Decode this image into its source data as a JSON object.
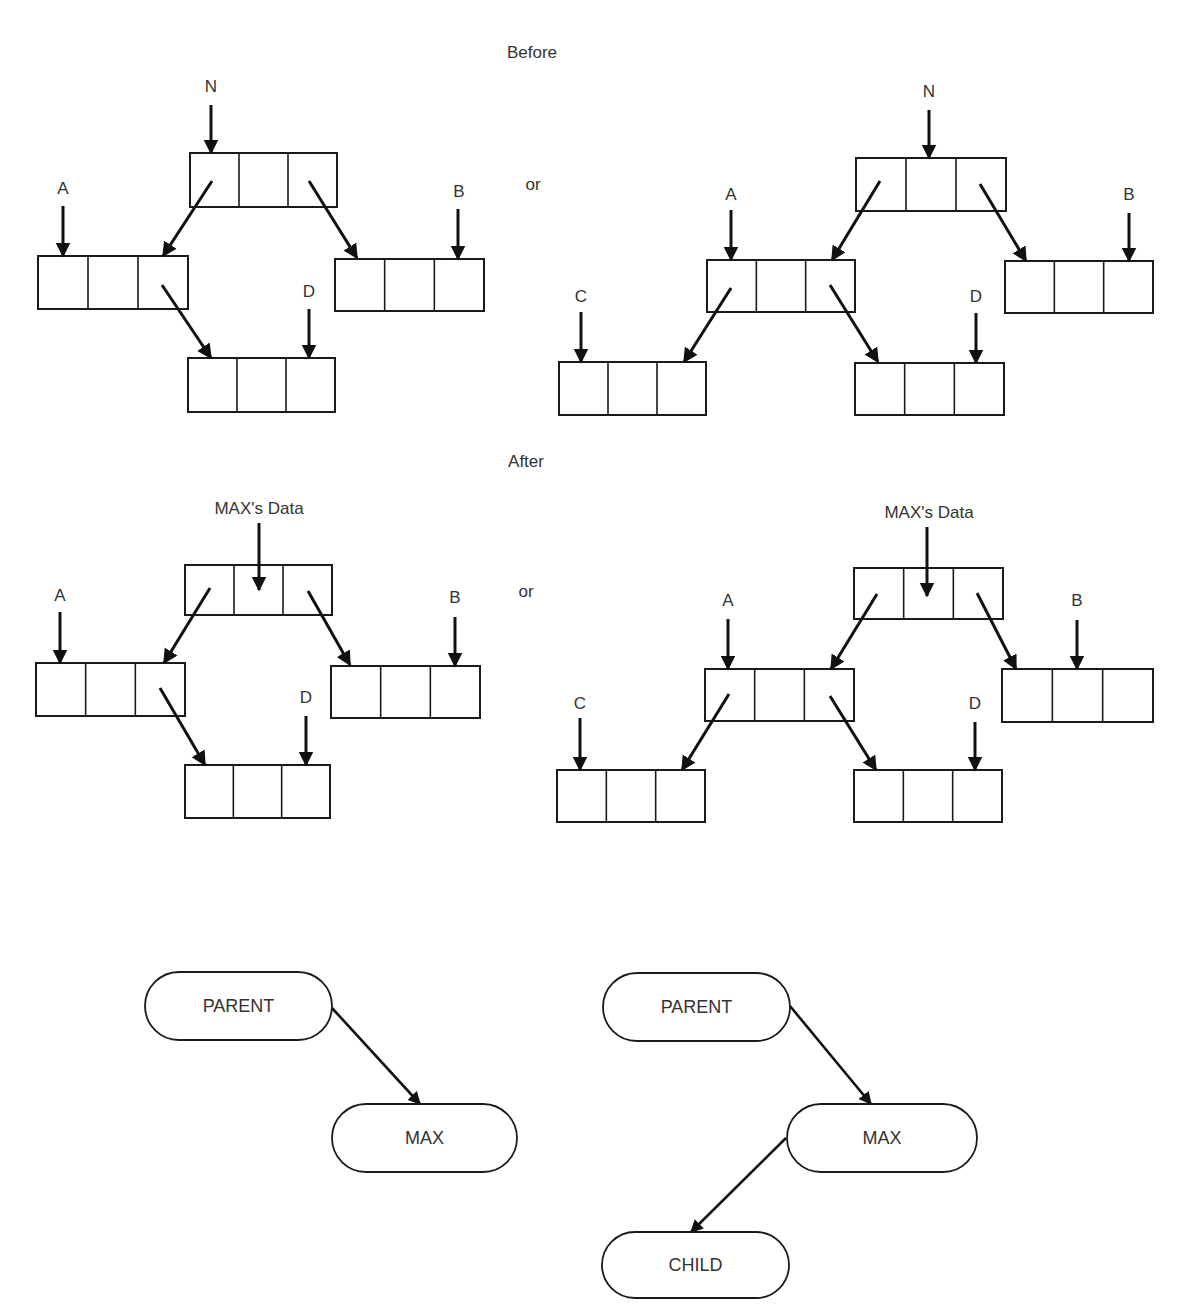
{
  "figure": {
    "section_before_label": "Before",
    "section_after_label": "After",
    "or_label": "or",
    "colors": {
      "ink": "#1a1a1a",
      "text": "#333333",
      "background": "#ffffff"
    }
  },
  "sections": [
    {
      "id": "before",
      "title": {
        "text": "Before",
        "x": 532,
        "y": 58
      },
      "or_text": {
        "text": "or",
        "x": 533,
        "y": 190
      },
      "diagrams": [
        {
          "id": "before-left",
          "boxes": [
            {
              "id": "N",
              "x": 190,
              "y": 153,
              "w": 147,
              "h": 54
            },
            {
              "id": "A",
              "x": 38,
              "y": 256,
              "w": 150,
              "h": 53
            },
            {
              "id": "B",
              "x": 335,
              "y": 259,
              "w": 149,
              "h": 52
            },
            {
              "id": "D",
              "x": 188,
              "y": 358,
              "w": 147,
              "h": 54
            }
          ],
          "pointer_labels": [
            {
              "text": "N",
              "x": 211,
              "y": 92,
              "arrow": [
                211,
                105,
                211,
                153
              ]
            },
            {
              "text": "A",
              "x": 63,
              "y": 194,
              "arrow": [
                63,
                206,
                63,
                256
              ]
            },
            {
              "text": "B",
              "x": 459,
              "y": 197,
              "arrow": [
                458,
                209,
                458,
                259
              ]
            },
            {
              "text": "D",
              "x": 309,
              "y": 297,
              "arrow": [
                309,
                309,
                309,
                358
              ]
            }
          ],
          "links": [
            [
              212,
              181,
              163,
              256
            ],
            [
              309,
              181,
              357,
              258
            ],
            [
              162,
              285,
              211,
              358
            ]
          ]
        },
        {
          "id": "before-right",
          "boxes": [
            {
              "id": "N",
              "x": 856,
              "y": 158,
              "w": 150,
              "h": 53
            },
            {
              "id": "A",
              "x": 707,
              "y": 260,
              "w": 148,
              "h": 52
            },
            {
              "id": "B",
              "x": 1005,
              "y": 261,
              "w": 148,
              "h": 52
            },
            {
              "id": "C",
              "x": 559,
              "y": 362,
              "w": 147,
              "h": 53
            },
            {
              "id": "D",
              "x": 855,
              "y": 363,
              "w": 149,
              "h": 52
            }
          ],
          "pointer_labels": [
            {
              "text": "N",
              "x": 929,
              "y": 97,
              "arrow": [
                929,
                110,
                929,
                158
              ]
            },
            {
              "text": "A",
              "x": 731,
              "y": 200,
              "arrow": [
                731,
                210,
                731,
                260
              ]
            },
            {
              "text": "B",
              "x": 1129,
              "y": 200,
              "arrow": [
                1129,
                213,
                1129,
                261
              ]
            },
            {
              "text": "C",
              "x": 581,
              "y": 302,
              "arrow": [
                581,
                312,
                581,
                362
              ]
            },
            {
              "text": "D",
              "x": 976,
              "y": 302,
              "arrow": [
                976,
                313,
                976,
                363
              ]
            }
          ],
          "links": [
            [
              880,
              181,
              832,
              260
            ],
            [
              980,
              184,
              1026,
              261
            ],
            [
              731,
              288,
              684,
              362
            ],
            [
              830,
              285,
              878,
              362
            ]
          ]
        }
      ]
    },
    {
      "id": "after",
      "title": {
        "text": "After",
        "x": 526,
        "y": 467
      },
      "or_text": {
        "text": "or",
        "x": 526,
        "y": 597
      },
      "diagrams": [
        {
          "id": "after-left",
          "boxes": [
            {
              "id": "MAX",
              "x": 185,
              "y": 565,
              "w": 147,
              "h": 50
            },
            {
              "id": "A",
              "x": 36,
              "y": 663,
              "w": 149,
              "h": 53
            },
            {
              "id": "B",
              "x": 331,
              "y": 666,
              "w": 149,
              "h": 52
            },
            {
              "id": "D",
              "x": 185,
              "y": 765,
              "w": 145,
              "h": 53
            }
          ],
          "pointer_labels": [
            {
              "text": "MAX's Data",
              "x": 259,
              "y": 514,
              "arrow": [
                259,
                523,
                259,
                590
              ]
            },
            {
              "text": "A",
              "x": 60,
              "y": 601,
              "arrow": [
                60,
                612,
                60,
                663
              ]
            },
            {
              "text": "B",
              "x": 455,
              "y": 603,
              "arrow": [
                455,
                617,
                455,
                666
              ]
            },
            {
              "text": "D",
              "x": 306,
              "y": 703,
              "arrow": [
                306,
                716,
                306,
                765
              ]
            }
          ],
          "links": [
            [
              210,
              588,
              164,
              663
            ],
            [
              308,
              591,
              350,
              665
            ],
            [
              160,
              688,
              205,
              765
            ]
          ]
        },
        {
          "id": "after-right",
          "boxes": [
            {
              "id": "MAX",
              "x": 854,
              "y": 568,
              "w": 149,
              "h": 51
            },
            {
              "id": "A",
              "x": 705,
              "y": 669,
              "w": 149,
              "h": 52
            },
            {
              "id": "B",
              "x": 1002,
              "y": 669,
              "w": 151,
              "h": 53
            },
            {
              "id": "C",
              "x": 557,
              "y": 770,
              "w": 148,
              "h": 52
            },
            {
              "id": "D",
              "x": 854,
              "y": 770,
              "w": 148,
              "h": 52
            }
          ],
          "pointer_labels": [
            {
              "text": "MAX's Data",
              "x": 929,
              "y": 518,
              "arrow": [
                927,
                527,
                927,
                596
              ]
            },
            {
              "text": "A",
              "x": 728,
              "y": 606,
              "arrow": [
                728,
                619,
                728,
                669
              ]
            },
            {
              "text": "B",
              "x": 1077,
              "y": 606,
              "arrow": [
                1077,
                620,
                1077,
                669
              ]
            },
            {
              "text": "C",
              "x": 580,
              "y": 709,
              "arrow": [
                580,
                718,
                580,
                770
              ]
            },
            {
              "text": "D",
              "x": 975,
              "y": 709,
              "arrow": [
                975,
                722,
                975,
                770
              ]
            }
          ],
          "links": [
            [
              877,
              594,
              831,
              669
            ],
            [
              977,
              593,
              1016,
              669
            ],
            [
              729,
              694,
              682,
              770
            ],
            [
              830,
              696,
              876,
              770
            ]
          ]
        }
      ]
    }
  ],
  "tree_diagrams": [
    {
      "id": "tree-left",
      "nodes": [
        {
          "id": "parent",
          "label": "PARENT",
          "x": 145,
          "y": 972,
          "w": 187,
          "h": 68
        },
        {
          "id": "max",
          "label": "MAX",
          "x": 332,
          "y": 1104,
          "w": 185,
          "h": 68
        }
      ],
      "edges": [
        [
          332,
          1008,
          420,
          1104
        ]
      ]
    },
    {
      "id": "tree-right",
      "nodes": [
        {
          "id": "parent",
          "label": "PARENT",
          "x": 603,
          "y": 973,
          "w": 187,
          "h": 68
        },
        {
          "id": "max",
          "label": "MAX",
          "x": 787,
          "y": 1104,
          "w": 190,
          "h": 68
        },
        {
          "id": "child",
          "label": "CHILD",
          "x": 602,
          "y": 1232,
          "w": 187,
          "h": 66
        }
      ],
      "edges": [
        [
          790,
          1006,
          871,
          1104
        ],
        [
          786,
          1138,
          691,
          1232
        ]
      ]
    }
  ]
}
